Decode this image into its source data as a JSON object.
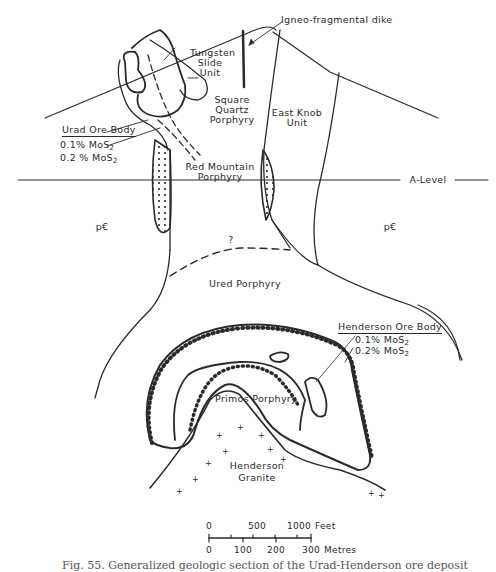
{
  "figure": {
    "caption": "Fig. 55. Generalized geologic section of the Urad-Henderson ore deposit",
    "labels": {
      "igneo_fragmental_dike": "Igneo-fragmental dike",
      "tungsten_slide_1": "Tungsten",
      "tungsten_slide_2": "Slide",
      "tungsten_slide_3": "Unit",
      "square_quartz_1": "Square",
      "square_quartz_2": "Quartz",
      "square_quartz_3": "Porphyry",
      "east_knob_1": "East Knob",
      "east_knob_2": "Unit",
      "urad_ore_body": "Urad Ore Body",
      "urad_grade_1_prefix": "0.1% MoS",
      "urad_grade_2_prefix": "0.2 % MoS",
      "subscript_2": "2",
      "red_mountain_1": "Red Mountain",
      "red_mountain_2": "Porphyry",
      "a_level": "A-Level",
      "precambrian_left": "p€",
      "precambrian_right": "p€",
      "question_mark": "?",
      "ured_porphyry": "Ured Porphyry",
      "henderson_ore_body": "Henderson Ore Body",
      "henderson_grade_1_prefix": "0.1% MoS",
      "henderson_grade_2_prefix": "0.2% MoS",
      "primos_porphyry": "Primos Porphyry",
      "henderson_granite_1": "Henderson",
      "henderson_granite_2": "Granite"
    },
    "scale_bar": {
      "feet_ticks": [
        "0",
        "500",
        "1000"
      ],
      "feet_unit": "Feet",
      "metres_ticks": [
        "0",
        "100",
        "200",
        "300"
      ],
      "metres_unit": "Metres"
    },
    "colors": {
      "ink": "#2a2a2a",
      "background": "#ffffff"
    }
  }
}
